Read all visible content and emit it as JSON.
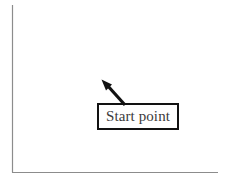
{
  "figure": {
    "width": 228,
    "height": 180,
    "background_color": "#ffffff",
    "axes": {
      "name": "l-shaped-axes",
      "line_color": "#8c8c8c",
      "line_width": 1,
      "vertical": {
        "x": 12,
        "y_top": 5,
        "y_bottom": 172
      },
      "horizontal": {
        "y": 172,
        "x_left": 12,
        "x_right": 218
      },
      "tick_labels": [],
      "xlabel": "",
      "ylabel": ""
    },
    "annotation": {
      "name": "start-point-callout",
      "label": "Start point",
      "text_color": "#3b3b3b",
      "box": {
        "x": 97,
        "y": 103,
        "width": 82,
        "height": 27,
        "border_color": "#121212",
        "border_width": 2,
        "fill_color": "#ffffff"
      },
      "arrow": {
        "name": "callout-arrow",
        "color": "#121212",
        "line_width": 3,
        "tail_x": 125,
        "tail_y": 105,
        "tip_x": 102,
        "tip_y": 80,
        "head_style": "solid-triangle"
      }
    }
  }
}
